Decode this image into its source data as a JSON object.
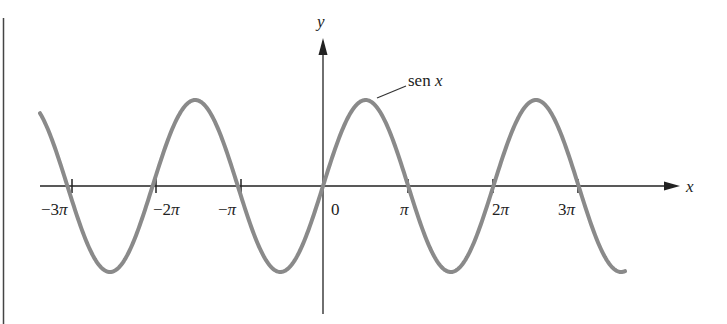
{
  "chart_data": {
    "type": "line",
    "title": "",
    "xlabel": "x",
    "ylabel": "y",
    "series": [
      {
        "name": "sen x",
        "function": "sin(x)",
        "x_range": [
          "-3.4π",
          "3.5π"
        ],
        "color": "#8a8a8a"
      }
    ],
    "x_ticks": [
      "-3π",
      "-2π",
      "-π",
      "0",
      "π",
      "2π",
      "3π"
    ],
    "x_tick_values": [
      -9.4248,
      -6.2832,
      -3.1416,
      0,
      3.1416,
      6.2832,
      9.4248
    ],
    "ylim": [
      -1.2,
      1.2
    ],
    "grid": false,
    "legend": "inline annotation near first positive peak"
  },
  "labels": {
    "x_axis": "x",
    "y_axis": "y",
    "curve": "sen x",
    "curve_word": "sen",
    "curve_var": "x",
    "ticks": [
      {
        "minus": "−",
        "coef": "3",
        "pi": "π"
      },
      {
        "minus": "−",
        "coef": "2",
        "pi": "π"
      },
      {
        "minus": "−",
        "coef": "",
        "pi": "π"
      },
      {
        "text": "0"
      },
      {
        "minus": "",
        "coef": "",
        "pi": "π"
      },
      {
        "minus": "",
        "coef": "2",
        "pi": "π"
      },
      {
        "minus": "",
        "coef": "3",
        "pi": "π"
      }
    ]
  },
  "colors": {
    "curve": "#8a8a8a",
    "axes": "#222222",
    "background": "#ffffff"
  }
}
